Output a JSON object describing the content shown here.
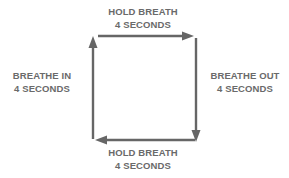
{
  "diagram": {
    "steps": [
      {
        "position": "left",
        "line1": "BREATHE IN",
        "line2": "4 SECONDS"
      },
      {
        "position": "top",
        "line1": "HOLD BREATH",
        "line2": "4 SECONDS"
      },
      {
        "position": "right",
        "line1": "BREATHE OUT",
        "line2": "4 SECONDS"
      },
      {
        "position": "bottom",
        "line1": "HOLD BREATH",
        "line2": "4 SECONDS"
      }
    ],
    "colors": {
      "line": "#666666",
      "text": "#6a6a6a",
      "background": "#ffffff"
    }
  }
}
